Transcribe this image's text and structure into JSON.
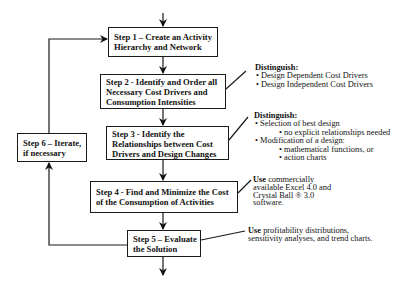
{
  "diagram": {
    "type": "flowchart",
    "steps": [
      {
        "id": "step1",
        "lines": [
          "Step 1 – Create an Activity",
          "Hierarchy and Network"
        ]
      },
      {
        "id": "step2",
        "lines": [
          "Step 2 - Identify and Order all",
          "Necessary Cost Drivers and",
          "Consumption Intensities"
        ]
      },
      {
        "id": "step3",
        "lines": [
          "Step 3 - Identify the",
          "Relationships between Cost",
          "Drivers and Design Changes"
        ]
      },
      {
        "id": "step4",
        "lines": [
          "Step 4 - Find and Minimize the Cost",
          "of the Consumption of Activities"
        ]
      },
      {
        "id": "step5",
        "lines": [
          "Step 5 – Evaluate",
          "the Solution"
        ]
      },
      {
        "id": "step6",
        "lines": [
          "Step 6 – Iterate,",
          "if necessary"
        ]
      }
    ],
    "annotations": {
      "step2": {
        "heading": "Distinguish:",
        "items": [
          "• Design Dependent Cost Drivers",
          "• Design Independent Cost Drivers"
        ]
      },
      "step3": {
        "heading": "Distinguish:",
        "items": [
          {
            "level": 1,
            "text": "• Selection of best design"
          },
          {
            "level": 2,
            "text": "• no explicit relationships needed"
          },
          {
            "level": 1,
            "text": "• Modification of a design:"
          },
          {
            "level": 2,
            "text": "• mathematical functions, or"
          },
          {
            "level": 2,
            "text": "• action charts"
          }
        ]
      },
      "step4": {
        "use_word": "Use",
        "lines": [
          " commercially",
          "available Excel 4.0 and",
          "Crystal Ball ® 3.0",
          "software."
        ]
      },
      "step5": {
        "use_word": "Use",
        "lines": [
          " profitability distributions,",
          "sensitivity analyses, and trend charts."
        ]
      }
    },
    "edges": [
      [
        "entry",
        "step1"
      ],
      [
        "step1",
        "step2"
      ],
      [
        "step2",
        "step3"
      ],
      [
        "step3",
        "step4"
      ],
      [
        "step4",
        "step5"
      ],
      [
        "step5",
        "exit"
      ],
      [
        "step5",
        "step6"
      ],
      [
        "step6",
        "step1"
      ]
    ]
  }
}
